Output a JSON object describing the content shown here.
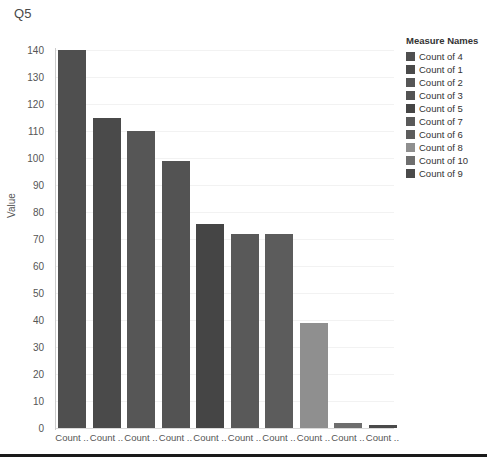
{
  "chart_data": {
    "type": "bar",
    "title": "Q5",
    "xlabel": "",
    "ylabel": "Value",
    "ylim": [
      0,
      140
    ],
    "ytick_step": 10,
    "grid": true,
    "legend_position": "right",
    "categories": [
      "Count ..",
      "Count ..",
      "Count ..",
      "Count ..",
      "Count ..",
      "Count ..",
      "Count ..",
      "Count ..",
      "Count ..",
      "Count .."
    ],
    "values": [
      140,
      115,
      110,
      99,
      75.5,
      72,
      72,
      39,
      2,
      1
    ],
    "bar_colors": [
      "#4f4f4f",
      "#4a4a4a",
      "#565656",
      "#535353",
      "#454545",
      "#595959",
      "#5c5c5c",
      "#8f8f8f",
      "#6e6e6e",
      "#4a4a4a"
    ],
    "yticks": [
      "140",
      "130",
      "120",
      "110",
      "100",
      "90",
      "80",
      "70",
      "60",
      "50",
      "40",
      "30",
      "20",
      "10",
      "0"
    ],
    "legend": {
      "title": "Measure Names",
      "entries": [
        {
          "label": "Count of 4",
          "color": "#4f4f4f"
        },
        {
          "label": "Count of 1",
          "color": "#4a4a4a"
        },
        {
          "label": "Count of 2",
          "color": "#565656"
        },
        {
          "label": "Count of 3",
          "color": "#535353"
        },
        {
          "label": "Count of 5",
          "color": "#454545"
        },
        {
          "label": "Count of 7",
          "color": "#595959"
        },
        {
          "label": "Count of 6",
          "color": "#5c5c5c"
        },
        {
          "label": "Count of 8",
          "color": "#8f8f8f"
        },
        {
          "label": "Count of 10",
          "color": "#6e6e6e"
        },
        {
          "label": "Count of 9",
          "color": "#4a4a4a"
        }
      ]
    }
  }
}
